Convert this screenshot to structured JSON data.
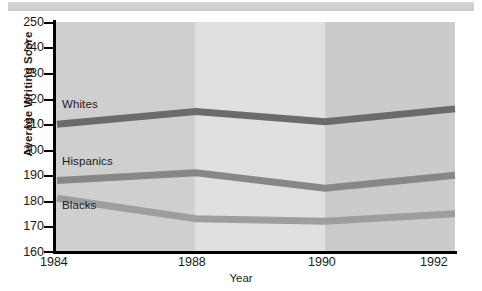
{
  "caption": {
    "strip_text": ""
  },
  "chart_data": {
    "type": "line",
    "title": "",
    "xlabel": "Year",
    "ylabel": "Average Writing Score",
    "categories": [
      "1984",
      "1988",
      "1990",
      "1992"
    ],
    "x": [
      1984,
      1988,
      1990,
      1992
    ],
    "ylim": [
      160,
      250
    ],
    "yticks": [
      160,
      170,
      180,
      190,
      200,
      210,
      220,
      230,
      240,
      250
    ],
    "ytick_labels": [
      "160",
      "170",
      "180",
      "190",
      "200",
      "210",
      "220",
      "230",
      "240",
      "250"
    ],
    "grid": false,
    "legend_position": "inline-labels",
    "series": [
      {
        "name": "Whites",
        "values": [
          210,
          215,
          211,
          216
        ],
        "color": "#6b6b6b",
        "label": "Whites"
      },
      {
        "name": "Hispanics",
        "values": [
          188,
          191,
          185,
          190
        ],
        "color": "#878787",
        "label": "Hispanics"
      },
      {
        "name": "Blacks",
        "values": [
          181,
          173,
          172,
          175
        ],
        "color": "#9e9e9e",
        "label": "Blacks"
      }
    ],
    "bands": [
      {
        "from": "1984",
        "to": "1988",
        "color": "#cfcfcf"
      },
      {
        "from": "1988",
        "to": "1990",
        "color": "#e0e0e0"
      },
      {
        "from": "1990",
        "to": "1992",
        "color": "#cbcbcb"
      }
    ],
    "axis_color": "#000000"
  },
  "axis": {
    "y_title": "Average Writing Score",
    "x_title": "Year",
    "y_ticks": [
      "250",
      "240",
      "230",
      "220",
      "210",
      "200",
      "190",
      "180",
      "170",
      "160"
    ],
    "x_ticks": [
      "1984",
      "1988",
      "1990",
      "1992"
    ]
  },
  "series_labels": {
    "whites": "Whites",
    "hispanics": "Hispanics",
    "blacks": "Blacks"
  }
}
